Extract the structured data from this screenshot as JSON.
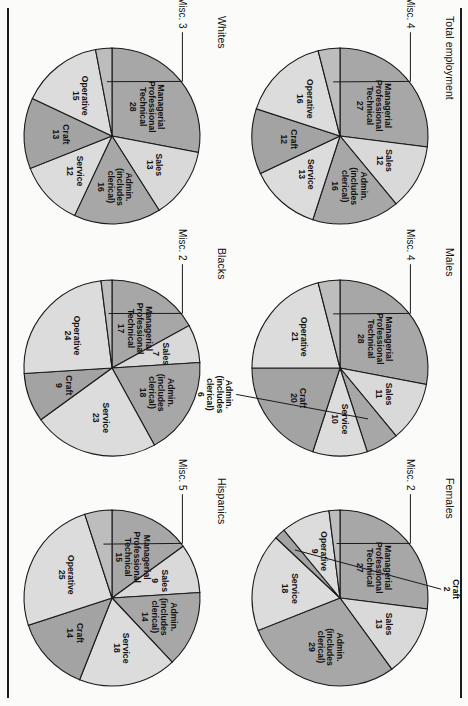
{
  "figure": {
    "orientation": "rotated-90-clockwise",
    "rules": [
      "top-rule",
      "bottom-rule"
    ]
  },
  "palette": {
    "managerial": "#a7a7a7",
    "sales": "#d9d9d9",
    "admin": "#a7a7a7",
    "service": "#dcdcdc",
    "craft": "#a3a3a3",
    "operative": "#dcdcdc",
    "misc": "#bdbdbd",
    "outline": "#1a1a1a",
    "paper": "#fbfbf9"
  },
  "chart_data": [
    {
      "type": "pie",
      "title": "Total employment",
      "units": "percent",
      "labels": [
        "Managerial Professional Technical",
        "Sales",
        "Admin. (includes clerical)",
        "Service",
        "Craft",
        "Operative",
        "Misc."
      ],
      "values": [
        27,
        12,
        16,
        13,
        12,
        16,
        4
      ],
      "slice_texts": [
        {
          "line1": "Managerial",
          "line2": "Professional",
          "line3": "Technical",
          "value": "27"
        },
        {
          "line1": "Sales",
          "value": "12"
        },
        {
          "line1": "Admin.",
          "line2": "(includes",
          "line3": "clerical)",
          "value": "16"
        },
        {
          "line1": "Service",
          "value": "13"
        },
        {
          "line1": "Craft",
          "value": "12"
        },
        {
          "line1": "Operative",
          "value": "16"
        },
        {
          "line1": "Misc.",
          "value": "4"
        }
      ],
      "misc_label": "Misc. 4"
    },
    {
      "type": "pie",
      "title": "Males",
      "units": "percent",
      "labels": [
        "Managerial Professional Technical",
        "Sales",
        "Admin. (includes clerical)",
        "Service",
        "Craft",
        "Operative",
        "Misc."
      ],
      "values": [
        28,
        11,
        6,
        10,
        20,
        21,
        4
      ],
      "slice_texts": [
        {
          "line1": "Managerial",
          "line2": "Professional",
          "line3": "Technical",
          "value": "28"
        },
        {
          "line1": "Sales",
          "value": "11"
        },
        {
          "line1": "Admin.",
          "line2": "(includes",
          "line3": "clerical)",
          "value": "6"
        },
        {
          "line1": "Service",
          "value": "10"
        },
        {
          "line1": "Craft",
          "value": "20"
        },
        {
          "line1": "Operative",
          "value": "21"
        },
        {
          "line1": "Misc.",
          "value": "4"
        }
      ],
      "misc_label": "Misc. 4",
      "admin_callout": true
    },
    {
      "type": "pie",
      "title": "Females",
      "units": "percent",
      "labels": [
        "Managerial Professional Technical",
        "Sales",
        "Admin. (includes clerical)",
        "Service",
        "Craft",
        "Operative",
        "Misc."
      ],
      "values": [
        27,
        13,
        29,
        18,
        2,
        9,
        2
      ],
      "slice_texts": [
        {
          "line1": "Managerial",
          "line2": "Professional",
          "line3": "Technical",
          "value": "27"
        },
        {
          "line1": "Sales",
          "value": "13"
        },
        {
          "line1": "Admin.",
          "line2": "(includes",
          "line3": "clerical)",
          "value": "29"
        },
        {
          "line1": "Service",
          "value": "18"
        },
        {
          "line1": "Craft",
          "value": "2"
        },
        {
          "line1": "Operative",
          "value": "9"
        },
        {
          "line1": "Misc.",
          "value": "2"
        }
      ],
      "misc_label": "Misc. 2",
      "craft_callout": "Craft 2"
    },
    {
      "type": "pie",
      "title": "Whites",
      "units": "percent",
      "labels": [
        "Managerial Professional Technical",
        "Sales",
        "Admin. (includes clerical)",
        "Service",
        "Craft",
        "Operative",
        "Misc."
      ],
      "values": [
        28,
        13,
        16,
        12,
        13,
        15,
        3
      ],
      "slice_texts": [
        {
          "line1": "Managerial",
          "line2": "Professional",
          "line3": "Technical",
          "value": "28"
        },
        {
          "line1": "Sales",
          "value": "13"
        },
        {
          "line1": "Admin.",
          "line2": "(includes",
          "line3": "clerical)",
          "value": "16"
        },
        {
          "line1": "Service",
          "value": "12"
        },
        {
          "line1": "Craft",
          "value": "13"
        },
        {
          "line1": "Operative",
          "value": "15"
        },
        {
          "line1": "Misc.",
          "value": "3"
        }
      ],
      "misc_label": "Misc. 3"
    },
    {
      "type": "pie",
      "title": "Blacks",
      "units": "percent",
      "labels": [
        "Managerial Professional Technical",
        "Sales",
        "Admin. (includes clerical)",
        "Service",
        "Craft",
        "Operative",
        "Misc."
      ],
      "values": [
        17,
        7,
        18,
        23,
        9,
        24,
        2
      ],
      "slice_texts": [
        {
          "line1": "Managerial",
          "line2": "Professional",
          "line3": "Technical",
          "value": "17"
        },
        {
          "line1": "Sales",
          "value": "7"
        },
        {
          "line1": "Admin.",
          "line2": "(includes",
          "line3": "clerical)",
          "value": "18"
        },
        {
          "line1": "Service",
          "value": "23"
        },
        {
          "line1": "Craft",
          "value": "9"
        },
        {
          "line1": "Operative",
          "value": "24"
        },
        {
          "line1": "Misc.",
          "value": "2"
        }
      ],
      "misc_label": "Misc. 2"
    },
    {
      "type": "pie",
      "title": "Hispanics",
      "units": "percent",
      "labels": [
        "Managerial Professional Technical",
        "Sales",
        "Admin. (includes clerical)",
        "Service",
        "Craft",
        "Operative",
        "Misc."
      ],
      "values": [
        15,
        9,
        14,
        18,
        14,
        25,
        5
      ],
      "slice_texts": [
        {
          "line1": "Managerial",
          "line2": "Professional",
          "line3": "Technical",
          "value": "15"
        },
        {
          "line1": "Sales",
          "value": "9"
        },
        {
          "line1": "Admin.",
          "line2": "(includes",
          "line3": "clerical)",
          "value": "14"
        },
        {
          "line1": "Service",
          "value": "18"
        },
        {
          "line1": "Craft",
          "value": "14"
        },
        {
          "line1": "Operative",
          "value": "25"
        },
        {
          "line1": "Misc.",
          "value": "5"
        }
      ],
      "misc_label": "Misc. 5"
    }
  ]
}
